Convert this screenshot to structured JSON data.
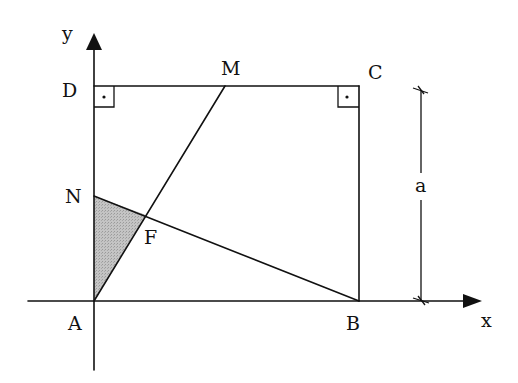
{
  "diagram": {
    "title": "",
    "axes": {
      "x_label": "x",
      "y_label": "y"
    },
    "points": {
      "A": {
        "label": "A"
      },
      "B": {
        "label": "B"
      },
      "C": {
        "label": "C"
      },
      "D": {
        "label": "D"
      },
      "M": {
        "label": "M"
      },
      "N": {
        "label": "N"
      },
      "F": {
        "label": "F"
      }
    },
    "dimension": {
      "label": "a"
    },
    "shaded_region": "triangle ANF",
    "right_angle_marks": [
      "D",
      "C"
    ],
    "colors": {
      "line": "#111111",
      "shade": "#b8b8b8",
      "background": "#ffffff"
    }
  }
}
